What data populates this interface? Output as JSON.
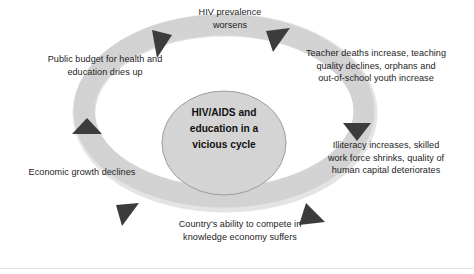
{
  "diagram": {
    "title": "HIV/AIDS and education in a vicious cycle",
    "center_label": "HIV/AIDS and\neducation in a\nvicious cycle",
    "flow_direction": "counterclockwise",
    "colors": {
      "ring": "#d9d9d9",
      "ring_shadow": "#cfcfcf",
      "ellipse_fill": "#d4d4d4",
      "ellipse_stroke": "#9a9a9a",
      "arrow": "#3d3d3d",
      "text": "#1d1d1d",
      "center_text": "#111111",
      "background": "#ffffff",
      "rule": "#e3e3e3"
    },
    "stages": [
      {
        "id": "hiv-prevalence",
        "position": "top",
        "label": "HIV prevalence\nworsens"
      },
      {
        "id": "teacher-deaths",
        "position": "upper-right",
        "label": "Teacher deaths increase, teaching\nquality declines, orphans and\nout-of-school youth increase"
      },
      {
        "id": "illiteracy",
        "position": "lower-right",
        "label": "Illiteracy increases, skilled\nwork force shrinks, quality of\nhuman capital deteriorates"
      },
      {
        "id": "knowledge-economy",
        "position": "bottom",
        "label": "Country's ability to compete in\nknowledge economy suffers"
      },
      {
        "id": "economic-growth",
        "position": "lower-left",
        "label": "Economic growth declines"
      },
      {
        "id": "public-budget",
        "position": "upper-left",
        "label": "Public budget for health and\neducation dries up"
      }
    ],
    "arrows": [
      {
        "id": "arrow-top-left",
        "direction": "down-left"
      },
      {
        "id": "arrow-top-right",
        "direction": "up-left"
      },
      {
        "id": "arrow-right",
        "direction": "down"
      },
      {
        "id": "arrow-bottom-right",
        "direction": "down-left"
      },
      {
        "id": "arrow-bottom-left",
        "direction": "up-left"
      },
      {
        "id": "arrow-left",
        "direction": "up"
      }
    ]
  }
}
